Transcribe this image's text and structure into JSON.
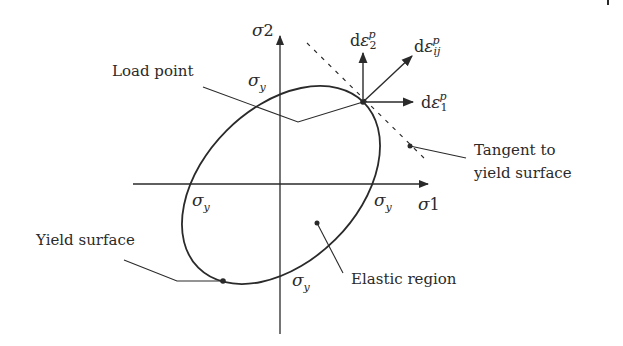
{
  "diagram": {
    "title": "",
    "colors": {
      "ink": "#2a2a2a",
      "background": "#ffffff"
    },
    "axes": {
      "horizontal": {
        "symbol": "σ",
        "subscript": "1"
      },
      "vertical": {
        "symbol": "σ",
        "subscript": "2"
      }
    },
    "intercepts": {
      "top": {
        "symbol": "σ",
        "subscript": "y"
      },
      "left": {
        "symbol": "σ",
        "subscript": "y"
      },
      "right": {
        "symbol": "σ",
        "subscript": "y"
      },
      "bottom": {
        "symbol": "σ",
        "subscript": "y"
      }
    },
    "vectors": {
      "d_eps_2": {
        "prefix": "d",
        "symbol": "ε",
        "superscript": "p",
        "subscript": "2"
      },
      "d_eps_ij": {
        "prefix": "d",
        "symbol": "ε",
        "superscript": "p",
        "subscript": "ij"
      },
      "d_eps_1": {
        "prefix": "d",
        "symbol": "ε",
        "superscript": "p",
        "subscript": "1"
      }
    },
    "labels": {
      "load_point": "Load point",
      "tangent_line1": "Tangent to",
      "tangent_line2": "yield surface",
      "yield_surface": "Yield surface",
      "elastic_region": "Elastic region"
    }
  }
}
